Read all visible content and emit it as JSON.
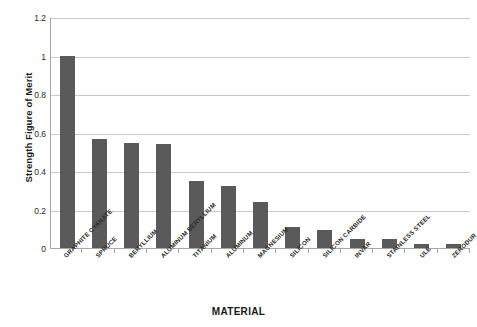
{
  "chart_data": {
    "type": "bar",
    "title": "",
    "xlabel": "MATERIAL",
    "ylabel": "Strength Figure of Merit",
    "ylim": [
      0,
      1.2
    ],
    "yticks": [
      "0",
      "0.2",
      "0.4",
      "0.6",
      "0.8",
      "1",
      "1.2"
    ],
    "ytick_values": [
      0,
      0.2,
      0.4,
      0.6,
      0.8,
      1,
      1.2
    ],
    "grid": true,
    "legend": "none",
    "bar_color": "#5a5a5a",
    "gridline_color": "#c8c8c8",
    "axis_color": "#a6a6a6",
    "categories": [
      "GRAPHITE CYANATE",
      "SPRUCE",
      "BERYLLIUM",
      "ALUMINUM BERYLLIUM",
      "TITANIUM",
      "ALUMINUM",
      "MAGNESIUM",
      "SILICON",
      "SILICON CARBIDE",
      "INVAR",
      "STAINLESS STEEL",
      "ULE",
      "ZERODUR"
    ],
    "values": [
      1.0,
      0.565,
      0.545,
      0.54,
      0.35,
      0.32,
      0.24,
      0.11,
      0.095,
      0.045,
      0.045,
      0.02,
      0.02
    ]
  }
}
